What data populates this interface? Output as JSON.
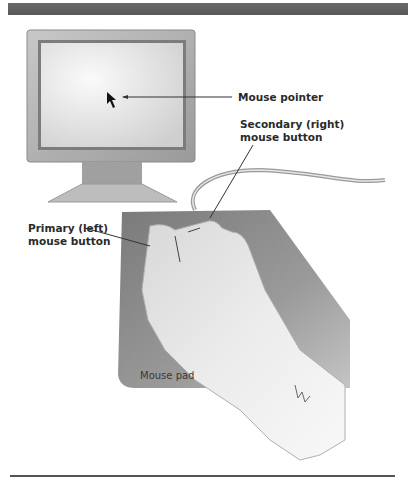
{
  "figure": {
    "labels": {
      "mouse_pointer": "Mouse pointer",
      "secondary_button_line1": "Secondary (right)",
      "secondary_button_line2": "mouse button",
      "primary_button_line1": "Primary (left)",
      "primary_button_line2": "mouse button",
      "mouse_pad": "Mouse pad"
    },
    "colors": {
      "top_bar": "#606060",
      "monitor_frame": "#a8a8a8",
      "screen": "#e6e6e6",
      "mouse_pad": "#8c8c8c",
      "hand": "#e8e8e8",
      "label_text": "#2a2a2a",
      "rule": "#555555"
    }
  }
}
